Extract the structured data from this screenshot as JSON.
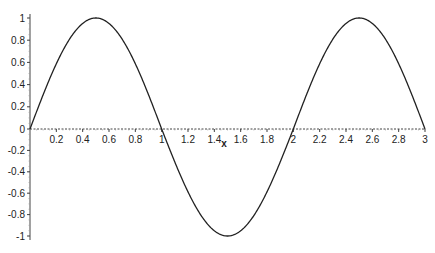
{
  "chart_data": {
    "type": "line",
    "title": "",
    "xlabel": "x",
    "ylabel": "",
    "function": "sin(pi*x)",
    "xlim": [
      0,
      3
    ],
    "ylim": [
      -1,
      1
    ],
    "grid": false,
    "legend": null,
    "x_ticks": [
      "0.2",
      "0.4",
      "0.6",
      "0.8",
      "1",
      "1.2",
      "1.4",
      "1.6",
      "1.8",
      "2",
      "2.2",
      "2.4",
      "2.6",
      "2.8",
      "3"
    ],
    "y_ticks": [
      "1",
      "0.8",
      "0.6",
      "0.4",
      "0.2",
      "0",
      "-0.2",
      "-0.4",
      "-0.6",
      "-0.8",
      "-1"
    ],
    "series": [
      {
        "name": "sin(pi x)",
        "color": "#222222",
        "x": [
          0,
          0.25,
          0.5,
          0.75,
          1,
          1.25,
          1.5,
          1.75,
          2,
          2.25,
          2.5,
          2.75,
          3
        ],
        "y": [
          0,
          0.707,
          1,
          0.707,
          0,
          -0.707,
          -1,
          -0.707,
          0,
          0.707,
          1,
          0.707,
          0
        ]
      }
    ]
  }
}
